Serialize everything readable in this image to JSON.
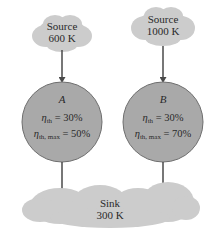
{
  "sources": [
    {
      "id": "source-a",
      "line1": "Source",
      "line2": "600 K"
    },
    {
      "id": "source-b",
      "line1": "Source",
      "line2": "1000 K"
    }
  ],
  "engines": [
    {
      "id": "engine-a",
      "name": "A",
      "eta_th_symbol": "η",
      "eta_th_sub": "th",
      "eta_th_value": " = 30%",
      "eta_max_symbol": "η",
      "eta_max_sub": "th, max",
      "eta_max_value": " = 50%"
    },
    {
      "id": "engine-b",
      "name": "B",
      "eta_th_symbol": "η",
      "eta_th_sub": "th",
      "eta_th_value": " = 30%",
      "eta_max_symbol": "η",
      "eta_max_sub": "th, max",
      "eta_max_value": " = 70%"
    }
  ],
  "sink": {
    "line1": "Sink",
    "line2": "300 K"
  },
  "colors": {
    "cloud": "#c9c9c9",
    "circle": "#a9a9a9",
    "circle_stroke": "#6e6e6e",
    "arrow": "#4a4a4a"
  }
}
